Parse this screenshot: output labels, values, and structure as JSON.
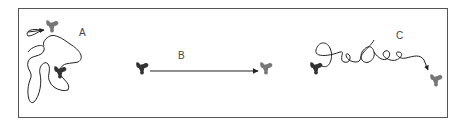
{
  "figure": {
    "panels": [
      {
        "id": "A",
        "label": "A",
        "description": "tortuous random path with start (light) and end (dark) molecule"
      },
      {
        "id": "B",
        "label": "B",
        "description": "straight directed path from dark molecule to light molecule"
      },
      {
        "id": "C",
        "label": "C",
        "description": "looping path from dark molecule to light molecule"
      }
    ],
    "colors": {
      "dark_molecule": "#333333",
      "light_molecule": "#777777",
      "path": "#222222",
      "frame": "#555555"
    }
  }
}
